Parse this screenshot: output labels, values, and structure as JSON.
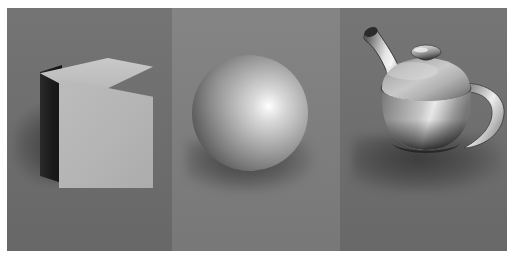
{
  "scene": {
    "title": "Three rendered 3D primitives on a gray studio backdrop",
    "description": "Grayscale computer-graphics render showing a cube, a sphere, and the Utah teapot arranged left to right across three adjoining gray background panels, each object casting a soft shadow to its lower left.",
    "render_style": "smooth-shaded grayscale raster render",
    "object_count": 3,
    "lighting": {
      "key_light_direction": "upper-right",
      "highlight_type": "specular",
      "shadow_direction": "lower-left"
    },
    "frame": {
      "mat_color": "#ffffff",
      "mat_top": 8,
      "mat_bottom": 8,
      "mat_left": 7,
      "mat_right": 8
    },
    "panels": [
      {
        "name": "left-panel",
        "label": "Panel 1",
        "color": "#6e6e6e",
        "x": 0,
        "width": 165
      },
      {
        "name": "middle-panel",
        "label": "Panel 2",
        "color": "#7f7f7f",
        "x": 165,
        "width": 168
      },
      {
        "name": "right-panel",
        "label": "Panel 3",
        "color": "#6f6f6f",
        "x": 333,
        "width": 167
      }
    ],
    "objects": [
      {
        "id": "cube",
        "label": "Cube",
        "shape": "cube",
        "panel": "left-panel",
        "faces": [
          {
            "name": "top-face",
            "label": "Top face",
            "color": "#c2c2c2",
            "note": "brightest, catching the key light"
          },
          {
            "name": "front-face",
            "label": "Front face",
            "color": "#b5b5b5",
            "note": "mid gray, evenly lit"
          },
          {
            "name": "left-face",
            "label": "Left face",
            "color": "#1a1a1a",
            "note": "in deep shadow, nearly black"
          }
        ],
        "shadow": {
          "name": "cube-shadow",
          "label": "Cast shadow",
          "opacity": "0.42",
          "direction": "left"
        }
      },
      {
        "id": "sphere",
        "label": "Sphere",
        "shape": "sphere",
        "panel": "middle-panel",
        "diameter_px": 116,
        "specular_highlight": {
          "label": "Specular highlight",
          "position": "upper-right of center",
          "color": "#ffffff"
        },
        "terminator": {
          "label": "Shadow terminator",
          "position": "lower-left limb",
          "color": "#2a2a2a"
        },
        "shadow": {
          "name": "sphere-shadow",
          "label": "Cast shadow",
          "opacity": "0.48",
          "direction": "below"
        }
      },
      {
        "id": "teapot",
        "label": "Utah Teapot",
        "shape": "teapot",
        "panel": "right-panel",
        "parts": [
          {
            "name": "teapot-body",
            "label": "Body",
            "color": "#b9b9b9"
          },
          {
            "name": "teapot-lid",
            "label": "Lid",
            "color": "#aeaeae"
          },
          {
            "name": "teapot-knob",
            "label": "Knob",
            "color": "#c4c4c4"
          },
          {
            "name": "teapot-spout",
            "label": "Spout",
            "color": "#c8c8c8",
            "note": "curves up and to the left, dark tip"
          },
          {
            "name": "teapot-handle",
            "label": "Handle",
            "color": "#c0c0c0",
            "note": "C-shaped loop on the right side"
          }
        ],
        "shadow": {
          "name": "teapot-shadow",
          "label": "Cast shadow",
          "opacity": "0.45",
          "direction": "lower-left"
        }
      }
    ],
    "colors": {
      "background_left": "#6e6e6e",
      "background_middle": "#7f7f7f",
      "background_right": "#6f6f6f",
      "highlight": "#ffffff",
      "deep_shadow": "#141414",
      "mat": "#ffffff"
    }
  }
}
